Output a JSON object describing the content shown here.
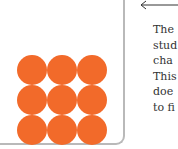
{
  "diagram": {
    "particle_color": "#f26a2a",
    "container_border_color": "#b9b9b9",
    "grid": {
      "rows": 3,
      "columns": 3,
      "count": 9
    },
    "arrow": {
      "direction": "left",
      "color": "#333333"
    },
    "caption_lines": [
      "The",
      "stud",
      "cha",
      "This",
      "doe",
      "to fi"
    ]
  }
}
